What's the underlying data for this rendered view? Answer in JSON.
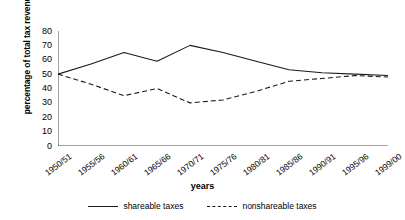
{
  "chart_data": {
    "type": "line",
    "title": "",
    "xlabel": "years",
    "ylabel": "percentage of total tax revenue",
    "categories": [
      "1950/51",
      "1955/56",
      "1960/61",
      "1965/66",
      "1970/71",
      "1975/76",
      "1980/81",
      "1985/86",
      "1990/91",
      "1995/96",
      "1999/00"
    ],
    "ylim": [
      0,
      80
    ],
    "yticks": [
      0,
      10,
      20,
      30,
      40,
      50,
      60,
      70,
      80
    ],
    "grid": false,
    "legend_position": "bottom",
    "series": [
      {
        "name": "shareable taxes",
        "style": "solid",
        "color": "#1a1a1a",
        "values": [
          50,
          57,
          65,
          59,
          70,
          65,
          59,
          53,
          51,
          50,
          49
        ]
      },
      {
        "name": "nonshareable taxes",
        "style": "dashed",
        "color": "#1a1a1a",
        "values": [
          50,
          43,
          35,
          40,
          30,
          32,
          38,
          45,
          47,
          49,
          48
        ]
      }
    ]
  },
  "axis": {
    "y_title": "percentage of total tax revenue",
    "x_title": "years"
  },
  "legend": {
    "items": [
      {
        "label": "shareable taxes",
        "style": "solid"
      },
      {
        "label": "nonshareable taxes",
        "style": "dashed"
      }
    ]
  }
}
